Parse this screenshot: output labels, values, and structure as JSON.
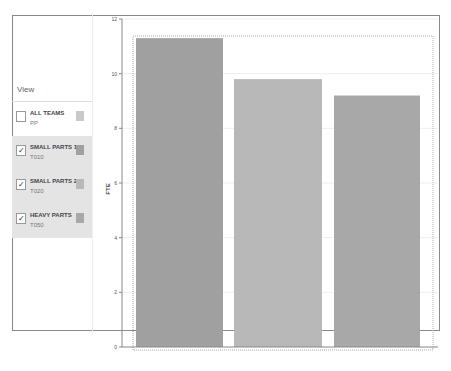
{
  "sidebar": {
    "view_label": "View",
    "items": [
      {
        "name": "ALL TEAMS",
        "code": "PP",
        "checked": false,
        "color": "#c8c8c8"
      },
      {
        "name": "SMALL PARTS 1",
        "code": "T010",
        "checked": true,
        "color": "#a0a0a0"
      },
      {
        "name": "SMALL PARTS 2",
        "code": "T020",
        "checked": true,
        "color": "#b8b8b8"
      },
      {
        "name": "HEAVY PARTS",
        "code": "T050",
        "checked": true,
        "color": "#a8a8a8"
      }
    ]
  },
  "chart_data": {
    "type": "bar",
    "title": "",
    "xlabel": "",
    "ylabel": "FTE",
    "ylim": [
      0,
      12
    ],
    "yticks": [
      0,
      2,
      4,
      6,
      8,
      10,
      12
    ],
    "grid": true,
    "categories": [
      "SMALL PARTS 1",
      "SMALL PARTS 2",
      "HEAVY PARTS"
    ],
    "values": [
      11.3,
      9.8,
      9.2
    ],
    "colors": [
      "#a0a0a0",
      "#b8b8b8",
      "#a8a8a8"
    ],
    "legend_position": "left"
  }
}
